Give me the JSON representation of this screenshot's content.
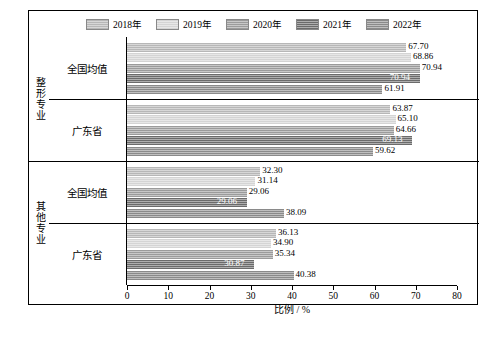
{
  "chart_data": {
    "type": "bar",
    "orientation": "horizontal",
    "title": "",
    "xlabel": "比例 / %",
    "ylabel": "",
    "xlim": [
      0,
      80
    ],
    "xticks": [
      0,
      10,
      20,
      30,
      40,
      50,
      60,
      70,
      80
    ],
    "grid": false,
    "legend_position": "top",
    "series": [
      {
        "name": "2018年",
        "color": "#b7b7b7"
      },
      {
        "name": "2019年",
        "color": "#d4d4d4"
      },
      {
        "name": "2020年",
        "color": "#9b9b9b"
      },
      {
        "name": "2021年",
        "color": "#6b6b6b"
      },
      {
        "name": "2022年",
        "color": "#8a8a8a"
      }
    ],
    "groups": [
      {
        "name": "整形专业",
        "categories": [
          {
            "label": "全国均值",
            "values": [
              67.7,
              68.86,
              70.94,
              70.94,
              61.91
            ]
          },
          {
            "label": "广东省",
            "values": [
              63.87,
              65.1,
              64.66,
              69.13,
              59.62
            ]
          }
        ]
      },
      {
        "name": "其他专业",
        "categories": [
          {
            "label": "全国均值",
            "values": [
              32.3,
              31.14,
              29.06,
              29.06,
              38.09
            ]
          },
          {
            "label": "广东省",
            "values": [
              36.13,
              34.9,
              35.34,
              30.87,
              40.38
            ]
          }
        ]
      }
    ]
  }
}
